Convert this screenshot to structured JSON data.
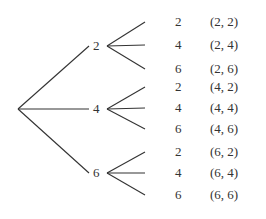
{
  "diagram": {
    "type": "tree",
    "line_color": "#333333",
    "root": {
      "x": 18,
      "y": 109
    },
    "first_level": [
      {
        "label": "2",
        "label_x": 93,
        "y": 46,
        "vertex_x": 107
      },
      {
        "label": "4",
        "label_x": 93,
        "y": 109,
        "vertex_x": 107
      },
      {
        "label": "6",
        "label_x": 93,
        "y": 173,
        "vertex_x": 107
      }
    ],
    "second_level": [
      {
        "parent": 0,
        "label": "2",
        "pair": "(2, 2)",
        "y": 22
      },
      {
        "parent": 0,
        "label": "4",
        "pair": "(2, 4)",
        "y": 45
      },
      {
        "parent": 0,
        "label": "6",
        "pair": "(2, 6)",
        "y": 69
      },
      {
        "parent": 1,
        "label": "2",
        "pair": "(4, 2)",
        "y": 87
      },
      {
        "parent": 1,
        "label": "4",
        "pair": "(4, 4)",
        "y": 108
      },
      {
        "parent": 1,
        "label": "6",
        "pair": "(4, 6)",
        "y": 129
      },
      {
        "parent": 2,
        "label": "2",
        "pair": "(6, 2)",
        "y": 152
      },
      {
        "parent": 2,
        "label": "4",
        "pair": "(6, 4)",
        "y": 173
      },
      {
        "parent": 2,
        "label": "6",
        "pair": "(6, 6)",
        "y": 195
      }
    ],
    "branch_end_x": 145,
    "second_label_x": 175,
    "pair_x": 210
  }
}
